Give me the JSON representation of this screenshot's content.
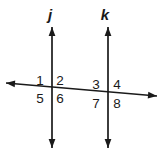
{
  "figure": {
    "background_color": "#ffffff",
    "stroke_color": "#1a1a1a",
    "width": 163,
    "height": 153
  },
  "lines": {
    "vertical": [
      {
        "name": "j",
        "label": "j",
        "label_x": 50,
        "label_y": 20,
        "x": 52,
        "y_top": 27,
        "y_bottom": 148,
        "arrow_top": true,
        "arrow_bottom": true
      },
      {
        "name": "k",
        "label": "k",
        "label_x": 105,
        "label_y": 20,
        "x": 108,
        "y_top": 27,
        "y_bottom": 148,
        "arrow_top": true,
        "arrow_bottom": true
      }
    ],
    "transversal": {
      "name": "transversal",
      "label": "",
      "x1": 6,
      "y1": 83,
      "x2": 157,
      "y2": 96,
      "arrow_start": true,
      "arrow_end": true
    }
  },
  "intersections": [
    {
      "name": "intersection-j",
      "x": 52,
      "y": 87
    },
    {
      "name": "intersection-k",
      "x": 108,
      "y": 92
    }
  ],
  "angle_labels": [
    {
      "id": "angle-1",
      "text": "1",
      "x": 40,
      "y": 85,
      "anchor": "middle"
    },
    {
      "id": "angle-2",
      "text": "2",
      "x": 60,
      "y": 85,
      "anchor": "middle"
    },
    {
      "id": "angle-5",
      "text": "5",
      "x": 40,
      "y": 103,
      "anchor": "middle"
    },
    {
      "id": "angle-6",
      "text": "6",
      "x": 60,
      "y": 103,
      "anchor": "middle"
    },
    {
      "id": "angle-3",
      "text": "3",
      "x": 96,
      "y": 89,
      "anchor": "middle"
    },
    {
      "id": "angle-4",
      "text": "4",
      "x": 117,
      "y": 89,
      "anchor": "middle"
    },
    {
      "id": "angle-7",
      "text": "7",
      "x": 96,
      "y": 108,
      "anchor": "middle"
    },
    {
      "id": "angle-8",
      "text": "8",
      "x": 117,
      "y": 108,
      "anchor": "middle"
    }
  ]
}
